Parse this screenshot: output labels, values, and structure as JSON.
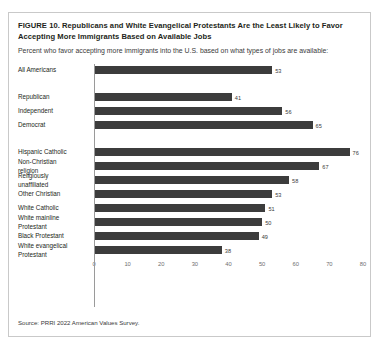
{
  "figure": {
    "title": "FIGURE 10.  Republicans and White Evangelical Protestants Are the Least Likely to Favor Accepting More Immigrants Based on Available Jobs",
    "subtitle": "Percent who favor accepting more immigrants into the U.S. based on what types of jobs are available:",
    "source": "Source: PRRI 2022 American Values Survey."
  },
  "chart_data": {
    "type": "bar",
    "orientation": "horizontal",
    "title": "FIGURE 10.  Republicans and White Evangelical Protestants Are the Least Likely to Favor Accepting More Immigrants Based on Available Jobs",
    "subtitle": "Percent who favor accepting more immigrants into the U.S. based on what types of jobs are available:",
    "xlabel": "",
    "ylabel": "",
    "xlim": [
      0,
      80
    ],
    "xticks": [
      0,
      10,
      20,
      30,
      40,
      50,
      60,
      70,
      80
    ],
    "grid": false,
    "legend": "none",
    "bar_color": "#3c3c3c",
    "categories": [
      "All Americans",
      "Republican",
      "Independent",
      "Democrat",
      "Hispanic Catholic",
      "Non-Christian\nreligion",
      "Religiously\nunaffiliated",
      "Other Christian",
      "White Catholic",
      "White mainline\nProtestant",
      "Black Protestant",
      "White evangelical\nProtestant"
    ],
    "values": [
      53,
      41,
      56,
      65,
      76,
      67,
      58,
      53,
      51,
      50,
      49,
      38
    ],
    "group_breaks_after": [
      "All Americans",
      "Democrat"
    ]
  }
}
